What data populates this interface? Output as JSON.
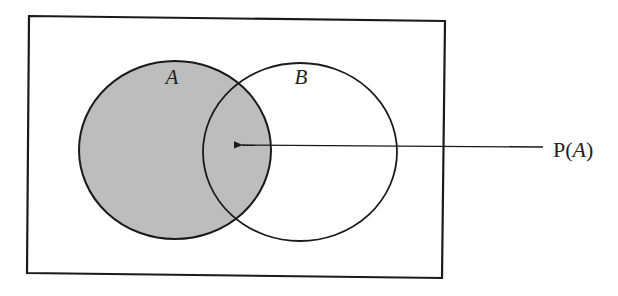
{
  "diagram": {
    "type": "venn",
    "universe": {
      "label": ""
    },
    "sets": [
      {
        "name": "A",
        "label": "A",
        "shaded": true,
        "fill": "#bdbdbd"
      },
      {
        "name": "B",
        "label": "B",
        "shaded": false,
        "fill": "#ffffff"
      }
    ],
    "annotation": {
      "text_prefix": "P(",
      "text_var": "A",
      "text_suffix": ")",
      "points_to": "A"
    },
    "colors": {
      "stroke": "#1a1a1a",
      "shade": "#bdbdbd",
      "background": "#ffffff"
    }
  }
}
